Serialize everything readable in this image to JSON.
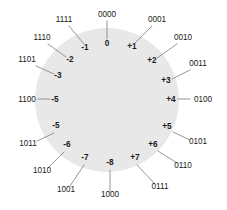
{
  "diagram": {
    "type": "number-circle",
    "bit_width": 4,
    "circle": {
      "cx": 107,
      "cy": 100,
      "r": 72,
      "fill": "#e8e8e8"
    },
    "colors": {
      "disc_fill": "#e8e8e8",
      "leader_line": "#8a8a8a",
      "text": "#1a1a1a",
      "background": "#ffffff"
    },
    "entries": [
      {
        "id": "pos-0",
        "decimal": "0",
        "binary": "0000",
        "angle_deg": 0,
        "inner": {
          "x": 107,
          "y": 46,
          "anchor": "middle"
        },
        "outer": {
          "x": 107,
          "y": 17,
          "anchor": "middle"
        },
        "leader": {
          "x1": 107,
          "y1": 21,
          "x2": 107,
          "y2": 39
        }
      },
      {
        "id": "pos-1",
        "decimal": "+1",
        "binary": "0001",
        "angle_deg": 22.5,
        "inner": {
          "x": 132,
          "y": 49,
          "anchor": "middle"
        },
        "outer": {
          "x": 157,
          "y": 22,
          "anchor": "middle"
        },
        "leader": {
          "x1": 152,
          "y1": 26,
          "x2": 135,
          "y2": 43
        }
      },
      {
        "id": "pos-2",
        "decimal": "+2",
        "binary": "0010",
        "angle_deg": 45,
        "inner": {
          "x": 152,
          "y": 63,
          "anchor": "middle"
        },
        "outer": {
          "x": 183,
          "y": 40,
          "anchor": "middle"
        },
        "leader": {
          "x1": 177,
          "y1": 44,
          "x2": 157,
          "y2": 58
        }
      },
      {
        "id": "pos-3",
        "decimal": "+3",
        "binary": "0011",
        "angle_deg": 67.5,
        "inner": {
          "x": 166,
          "y": 83,
          "anchor": "middle"
        },
        "outer": {
          "x": 198,
          "y": 66,
          "anchor": "middle"
        },
        "leader": {
          "x1": 190,
          "y1": 70,
          "x2": 172,
          "y2": 79
        }
      },
      {
        "id": "pos-4",
        "decimal": "+4",
        "binary": "0100",
        "angle_deg": 90,
        "inner": {
          "x": 171,
          "y": 102,
          "anchor": "middle"
        },
        "outer": {
          "x": 203,
          "y": 102,
          "anchor": "middle"
        },
        "leader": {
          "x1": 190,
          "y1": 99,
          "x2": 178,
          "y2": 99
        }
      },
      {
        "id": "pos-5",
        "decimal": "+5",
        "binary": "0101",
        "angle_deg": 112.5,
        "inner": {
          "x": 167,
          "y": 129,
          "anchor": "middle"
        },
        "outer": {
          "x": 198,
          "y": 144,
          "anchor": "middle"
        },
        "leader": {
          "x1": 190,
          "y1": 140,
          "x2": 173,
          "y2": 132
        }
      },
      {
        "id": "pos-6",
        "decimal": "+6",
        "binary": "0110",
        "angle_deg": 135,
        "inner": {
          "x": 153,
          "y": 147,
          "anchor": "middle"
        },
        "outer": {
          "x": 183,
          "y": 168,
          "anchor": "middle"
        },
        "leader": {
          "x1": 177,
          "y1": 163,
          "x2": 158,
          "y2": 151
        }
      },
      {
        "id": "pos-7",
        "decimal": "+7",
        "binary": "0111",
        "angle_deg": 157.5,
        "inner": {
          "x": 135,
          "y": 160,
          "anchor": "middle"
        },
        "outer": {
          "x": 160,
          "y": 189,
          "anchor": "middle"
        },
        "leader": {
          "x1": 155,
          "y1": 184,
          "x2": 137,
          "y2": 165
        }
      },
      {
        "id": "neg-8",
        "decimal": "-8",
        "binary": "1000",
        "angle_deg": 180,
        "inner": {
          "x": 110,
          "y": 165,
          "anchor": "middle"
        },
        "outer": {
          "x": 110,
          "y": 197,
          "anchor": "middle"
        },
        "leader": {
          "x1": 110,
          "y1": 192,
          "x2": 110,
          "y2": 170
        }
      },
      {
        "id": "neg-7",
        "decimal": "-7",
        "binary": "1001",
        "angle_deg": 202.5,
        "inner": {
          "x": 85,
          "y": 160,
          "anchor": "middle"
        },
        "outer": {
          "x": 66,
          "y": 192,
          "anchor": "middle"
        },
        "leader": {
          "x1": 70,
          "y1": 186,
          "x2": 84,
          "y2": 165
        }
      },
      {
        "id": "neg-6",
        "decimal": "-6",
        "binary": "1010",
        "angle_deg": 225,
        "inner": {
          "x": 67,
          "y": 147,
          "anchor": "middle"
        },
        "outer": {
          "x": 42,
          "y": 173,
          "anchor": "middle"
        },
        "leader": {
          "x1": 48,
          "y1": 168,
          "x2": 64,
          "y2": 152
        }
      },
      {
        "id": "neg-5b",
        "decimal": "-5",
        "binary": "1011",
        "angle_deg": 247.5,
        "inner": {
          "x": 56,
          "y": 128,
          "anchor": "middle"
        },
        "outer": {
          "x": 28,
          "y": 146,
          "anchor": "middle"
        },
        "leader": {
          "x1": 37,
          "y1": 141,
          "x2": 54,
          "y2": 133
        }
      },
      {
        "id": "neg-5a",
        "decimal": "-5",
        "binary": "1100",
        "angle_deg": 270,
        "inner": {
          "x": 55,
          "y": 102,
          "anchor": "middle"
        },
        "outer": {
          "x": 27,
          "y": 102,
          "anchor": "middle"
        },
        "leader": {
          "x1": 38,
          "y1": 99,
          "x2": 50,
          "y2": 99
        }
      },
      {
        "id": "neg-3",
        "decimal": "-3",
        "binary": "1101",
        "angle_deg": 292.5,
        "inner": {
          "x": 58,
          "y": 78,
          "anchor": "middle"
        },
        "outer": {
          "x": 27,
          "y": 62,
          "anchor": "middle"
        },
        "leader": {
          "x1": 36,
          "y1": 66,
          "x2": 54,
          "y2": 74
        }
      },
      {
        "id": "neg-2",
        "decimal": "-2",
        "binary": "1110",
        "angle_deg": 315,
        "inner": {
          "x": 70,
          "y": 62,
          "anchor": "middle"
        },
        "outer": {
          "x": 42,
          "y": 40,
          "anchor": "middle"
        },
        "leader": {
          "x1": 48,
          "y1": 44,
          "x2": 66,
          "y2": 57
        }
      },
      {
        "id": "neg-1",
        "decimal": "-1",
        "binary": "1111",
        "angle_deg": 337.5,
        "inner": {
          "x": 85,
          "y": 50,
          "anchor": "middle"
        },
        "outer": {
          "x": 64,
          "y": 22,
          "anchor": "middle"
        },
        "leader": {
          "x1": 69,
          "y1": 26,
          "x2": 84,
          "y2": 44
        }
      }
    ]
  }
}
